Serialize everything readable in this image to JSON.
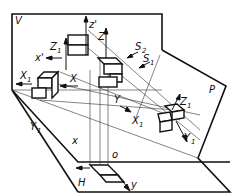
{
  "diagram": {
    "planes": {
      "V": "V",
      "H": "H",
      "P": "P"
    },
    "axes": {
      "z_prime": "z'",
      "x_prime": "x'",
      "x": "x",
      "y": "y",
      "o": "o",
      "Z": "Z",
      "X": "X",
      "Y": "Y",
      "Z1": "Z",
      "X1": "X",
      "Y1": "Y",
      "sub1": "1"
    },
    "directions": {
      "S1": "S",
      "S2": "S",
      "sub1": "1",
      "sub2": "2"
    }
  }
}
